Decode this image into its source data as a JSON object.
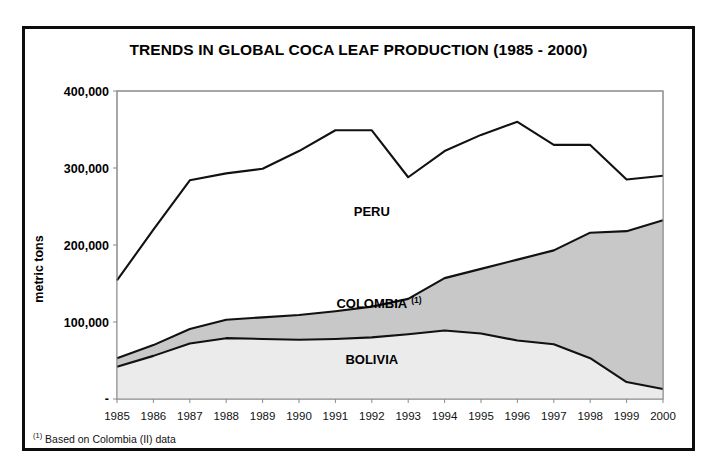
{
  "figure": {
    "title": "TRENDS IN GLOBAL COCA LEAF PRODUCTION (1985 - 2000)",
    "footnote_mark": "(1)",
    "footnote_text": "Based on Colombia (II) data",
    "frame_color": "#0d0d0d",
    "background": "#ffffff"
  },
  "chart_data": {
    "type": "area",
    "title": "TRENDS IN GLOBAL COCA LEAF PRODUCTION (1985 - 2000)",
    "xlabel": "",
    "ylabel": "metric tons",
    "ylim": [
      0,
      400000
    ],
    "ytick_labels": [
      "400,000",
      "300,000",
      "200,000",
      "100,000",
      "-"
    ],
    "ytick_values": [
      400000,
      300000,
      200000,
      100000,
      0
    ],
    "grid": false,
    "legend_position": "inline-labels",
    "stacked": true,
    "stack_order": [
      "BOLIVIA",
      "COLOMBIA",
      "PERU"
    ],
    "categories": [
      "1985",
      "1986",
      "1987",
      "1988",
      "1989",
      "1990",
      "1991",
      "1992",
      "1993",
      "1994",
      "1995",
      "1996",
      "1997",
      "1998",
      "1999",
      "2000"
    ],
    "series": [
      {
        "name": "BOLIVIA",
        "label": "BOLIVIA",
        "fill": "#ebebeb",
        "line_color": "#111111",
        "values": [
          42000,
          56000,
          72000,
          79000,
          78000,
          77000,
          78000,
          80000,
          84000,
          89000,
          85000,
          76000,
          71000,
          53000,
          22000,
          13000
        ]
      },
      {
        "name": "COLOMBIA",
        "label": "COLOMBIA",
        "label_sup": "(1)",
        "fill": "#c8c8c8",
        "line_color": "#111111",
        "values": [
          11000,
          14000,
          19000,
          24000,
          28000,
          32000,
          36000,
          40000,
          46000,
          68000,
          84000,
          105000,
          122000,
          163000,
          196000,
          219000
        ]
      },
      {
        "name": "PERU",
        "label": "PERU",
        "fill": "#ffffff",
        "line_color": "#111111",
        "values": [
          101000,
          150000,
          193000,
          190000,
          193000,
          213000,
          235000,
          229000,
          158000,
          165000,
          174000,
          179000,
          137000,
          114000,
          67000,
          58000
        ]
      }
    ],
    "cumulative_totals": [
      154000,
      220000,
      284000,
      293000,
      299000,
      322000,
      349000,
      349000,
      288000,
      322000,
      343000,
      360000,
      330000,
      330000,
      285000,
      290000
    ],
    "cumulative_bolivia_colombia": [
      53000,
      70000,
      91000,
      103000,
      106000,
      109000,
      114000,
      120000,
      130000,
      157000,
      169000,
      181000,
      193000,
      216000,
      218000,
      232000
    ],
    "annotations": [
      {
        "text": "PERU",
        "x_index": 7,
        "y_value": 238000
      },
      {
        "text": "COLOMBIA",
        "x_index": 7,
        "y_value": 118000,
        "superscript": "(1)"
      },
      {
        "text": "BOLIVIA",
        "x_index": 7,
        "y_value": 45000
      }
    ]
  }
}
